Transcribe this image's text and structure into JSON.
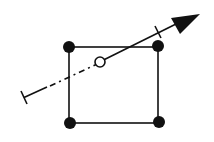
{
  "diagram": {
    "colors": {
      "stroke": "#111111",
      "fill": "#111111",
      "background": "#ffffff"
    },
    "elements": {
      "square": "square-outline",
      "vertices": [
        "vertex-top-left",
        "vertex-top-right",
        "vertex-bottom-left",
        "vertex-bottom-right"
      ],
      "center_point": "hollow-circle",
      "ray": {
        "start_cap": "t-bar",
        "hidden_segment_style": "dash-dot",
        "visible_segment_style": "solid",
        "end_cap": "arrowhead",
        "crossing_tick": true
      }
    }
  }
}
